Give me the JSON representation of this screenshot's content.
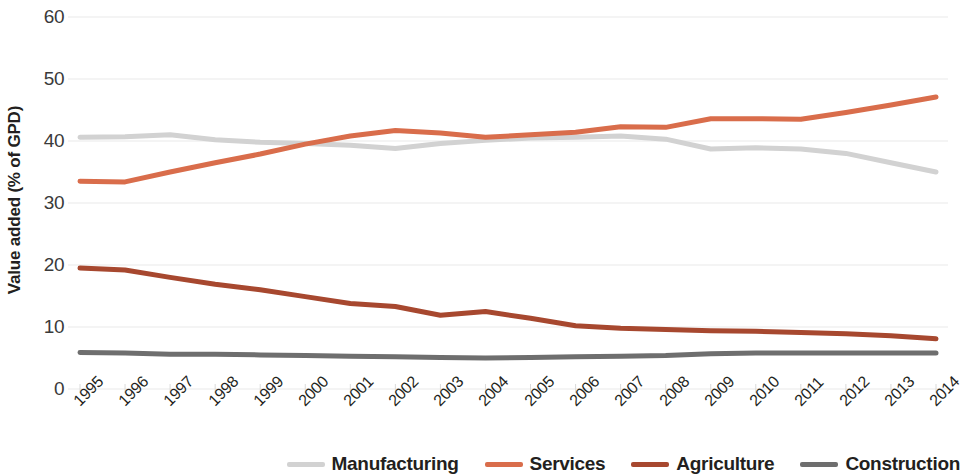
{
  "chart_data": {
    "type": "line",
    "title": "",
    "xlabel": "",
    "ylabel": "Value added (% of GPD)",
    "ylim": [
      0,
      60
    ],
    "ytick_values": [
      60,
      50,
      40,
      30,
      20,
      10,
      0
    ],
    "ytick_labels": [
      "60",
      "50",
      "40",
      "30",
      "20",
      "10",
      "0"
    ],
    "grid": true,
    "grid_axis": "y",
    "legend_position": "bottom-right",
    "categories": [
      "1995",
      "1996",
      "1997",
      "1998",
      "1999",
      "2000",
      "2001",
      "2002",
      "2003",
      "2004",
      "2005",
      "2006",
      "2007",
      "2008",
      "2009",
      "2010",
      "2011",
      "2012",
      "2013",
      "2014"
    ],
    "series": [
      {
        "name": "Manufacturing",
        "color": "#d2d2d2",
        "values": [
          40.6,
          40.7,
          41.0,
          40.2,
          39.8,
          39.6,
          39.3,
          38.8,
          39.6,
          40.1,
          40.5,
          40.6,
          40.8,
          40.3,
          38.7,
          38.9,
          38.7,
          38.0,
          36.5,
          35.0
        ]
      },
      {
        "name": "Services",
        "color": "#d96d4b",
        "values": [
          33.5,
          33.4,
          35.0,
          36.5,
          37.9,
          39.5,
          40.8,
          41.7,
          41.3,
          40.6,
          41.0,
          41.4,
          42.3,
          42.2,
          43.6,
          43.6,
          43.5,
          44.6,
          45.8,
          47.1
        ]
      },
      {
        "name": "Agriculture",
        "color": "#a7482f",
        "values": [
          19.5,
          19.2,
          18.0,
          16.9,
          16.0,
          14.9,
          13.8,
          13.3,
          11.9,
          12.5,
          11.4,
          10.2,
          9.8,
          9.6,
          9.4,
          9.3,
          9.1,
          8.9,
          8.6,
          8.1
        ]
      },
      {
        "name": "Construction",
        "color": "#6e6e6e",
        "values": [
          5.9,
          5.8,
          5.6,
          5.6,
          5.5,
          5.4,
          5.3,
          5.2,
          5.1,
          5.0,
          5.1,
          5.2,
          5.3,
          5.4,
          5.7,
          5.8,
          5.8,
          5.8,
          5.8,
          5.8
        ]
      }
    ]
  }
}
